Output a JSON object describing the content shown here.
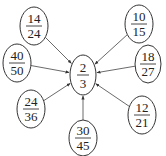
{
  "diagram": {
    "type": "equivalent-fractions-star",
    "center": {
      "numerator": "2",
      "denominator": "3",
      "cx": 83,
      "cy": 75,
      "rx": 13,
      "ry": 20
    },
    "nodes": [
      {
        "id": "f14_24",
        "numerator": "14",
        "denominator": "24",
        "cx": 34,
        "cy": 26,
        "rx": 14,
        "ry": 19
      },
      {
        "id": "f10_15",
        "numerator": "10",
        "denominator": "15",
        "cx": 139,
        "cy": 24,
        "rx": 14,
        "ry": 19
      },
      {
        "id": "f40_50",
        "numerator": "40",
        "denominator": "50",
        "cx": 17,
        "cy": 63,
        "rx": 14,
        "ry": 19
      },
      {
        "id": "f18_27",
        "numerator": "18",
        "denominator": "27",
        "cx": 148,
        "cy": 64,
        "rx": 13,
        "ry": 19
      },
      {
        "id": "f24_36",
        "numerator": "24",
        "denominator": "36",
        "cx": 31,
        "cy": 109,
        "rx": 14,
        "ry": 19
      },
      {
        "id": "f12_21",
        "numerator": "12",
        "denominator": "21",
        "cx": 142,
        "cy": 115,
        "rx": 14,
        "ry": 19
      },
      {
        "id": "f30_45",
        "numerator": "30",
        "denominator": "45",
        "cx": 83,
        "cy": 138,
        "rx": 14,
        "ry": 18
      }
    ],
    "colors": {
      "stroke": "#333333",
      "text": "#222222",
      "background": "#ffffff"
    }
  }
}
